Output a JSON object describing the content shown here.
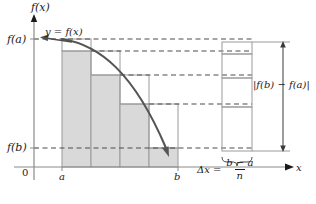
{
  "figure": {
    "type": "calculus-riemann-sum-diagram",
    "axes": {
      "y_axis_label": "f(x)",
      "x_axis_label": "x",
      "origin_label": "0"
    },
    "value_labels": {
      "f_a": "f(a)",
      "f_b": "f(b)",
      "a": "a",
      "b": "b"
    },
    "curve_label": "y = f(x)",
    "total_change_label": "|f(b) − f(a)|",
    "delta_x": {
      "symbol": "Δx",
      "equals": "=",
      "numerator": "b − a",
      "denominator": "n"
    },
    "colors": {
      "bar_fill": "#d9d9d9",
      "bar_stroke": "#9a9a9a",
      "curve": "#555555",
      "axis": "#8a8a8a",
      "dashed": "#4d4d4d",
      "text": "#1a1a1a"
    },
    "geometry": {
      "y_axis_x": 34,
      "x_axis_y": 167,
      "a_x": 62,
      "b_x": 178,
      "bar_count": 4,
      "bar_edges": [
        62,
        91,
        120,
        149,
        178
      ],
      "bar_tops": [
        51,
        75,
        104,
        148
      ],
      "f_a_y": 39,
      "f_b_y": 148,
      "dashed_levels": [
        39,
        51,
        75,
        104,
        148
      ],
      "stack_left": 222,
      "stack_right": 252,
      "stack_divisions": [
        42,
        54,
        78,
        107,
        151
      ]
    }
  }
}
